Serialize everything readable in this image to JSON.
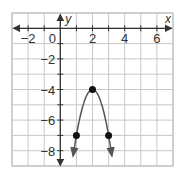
{
  "chart_data": {
    "type": "line",
    "title": "",
    "xlabel": "x",
    "ylabel": "y",
    "xlim": [
      -3,
      7
    ],
    "ylim": [
      -9,
      1
    ],
    "grid": true,
    "x_ticks": [
      -2,
      0,
      2,
      4,
      6
    ],
    "y_ticks": [
      -2,
      -4,
      -6,
      -8
    ],
    "function": "y = -3(x - 2)^2 - 4",
    "points": [
      {
        "x": 1,
        "y": -7
      },
      {
        "x": 2,
        "y": -4
      },
      {
        "x": 3,
        "y": -7
      }
    ],
    "vertex": {
      "x": 2,
      "y": -4
    },
    "curve_endpoints": [
      {
        "x": 0.8,
        "y": -8.9
      },
      {
        "x": 3.2,
        "y": -8.9
      }
    ],
    "colors": {
      "grid": "#c8c8c8",
      "axis": "#333333",
      "curve": "#555555",
      "point": "#111111"
    }
  },
  "labels": {
    "x_axis": "x",
    "y_axis": "y",
    "x_tick_labels": [
      "−2",
      "0",
      "2",
      "4",
      "6"
    ],
    "y_tick_labels": [
      "−2",
      "−4",
      "−6",
      "−8"
    ]
  }
}
